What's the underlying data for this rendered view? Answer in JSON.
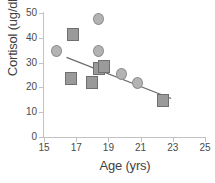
{
  "chart_data": {
    "type": "scatter",
    "title": "",
    "xlabel": "Age (yrs)",
    "ylabel": "Cortisol (ug/dl)",
    "xlim": [
      15,
      25
    ],
    "ylim": [
      0,
      50
    ],
    "xticks": [
      15,
      17,
      19,
      21,
      23,
      25
    ],
    "yticks": [
      0,
      10,
      20,
      30,
      40,
      50
    ],
    "grid": false,
    "legend": "none",
    "series": [
      {
        "name": "circles",
        "marker": "circle",
        "color": "#b3b3b3",
        "points": [
          {
            "x": 15.8,
            "y": 34.7
          },
          {
            "x": 18.4,
            "y": 47.5
          },
          {
            "x": 18.4,
            "y": 34.5
          },
          {
            "x": 19.8,
            "y": 25.6
          },
          {
            "x": 20.8,
            "y": 21.6
          }
        ]
      },
      {
        "name": "squares",
        "marker": "square",
        "color": "#9a9a9a",
        "points": [
          {
            "x": 16.8,
            "y": 41.4
          },
          {
            "x": 16.7,
            "y": 23.4
          },
          {
            "x": 18.0,
            "y": 22.0
          },
          {
            "x": 18.4,
            "y": 27.6
          },
          {
            "x": 18.7,
            "y": 28.3
          },
          {
            "x": 22.4,
            "y": 14.8
          }
        ]
      }
    ],
    "trendline": {
      "name": "linear-fit",
      "color": "#6b6b6b",
      "x_start": 16.4,
      "y_start": 32.1,
      "x_end": 22.9,
      "y_end": 15.5
    }
  }
}
